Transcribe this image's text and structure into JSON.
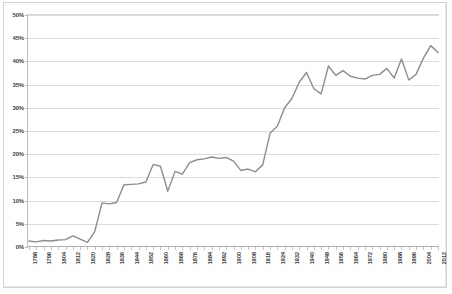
{
  "chart_data": {
    "type": "line",
    "title": "U.S. Popular Vote for President as Percentage of Total Population",
    "xlabel": "",
    "ylabel": "",
    "ylim": [
      0,
      50
    ],
    "ytick_labels": [
      "0%",
      "5%",
      "10%",
      "15%",
      "20%",
      "25%",
      "30%",
      "35%",
      "40%",
      "45%",
      "50%"
    ],
    "ytick_values": [
      0,
      5,
      10,
      15,
      20,
      25,
      30,
      35,
      40,
      45,
      50
    ],
    "grid": true,
    "legend": "none",
    "xtick_labels": [
      "1788",
      "1796",
      "1804",
      "1812",
      "1820",
      "1828",
      "1836",
      "1844",
      "1852",
      "1860",
      "1868",
      "1876",
      "1884",
      "1892",
      "1900",
      "1908",
      "1916",
      "1924",
      "1932",
      "1940",
      "1948",
      "1956",
      "1964",
      "1972",
      "1980",
      "1988",
      "1996",
      "2004",
      "2012"
    ],
    "x": [
      1788,
      1792,
      1796,
      1800,
      1804,
      1808,
      1812,
      1816,
      1820,
      1824,
      1828,
      1832,
      1836,
      1840,
      1844,
      1848,
      1852,
      1856,
      1860,
      1864,
      1868,
      1872,
      1876,
      1880,
      1884,
      1888,
      1892,
      1896,
      1900,
      1904,
      1908,
      1912,
      1916,
      1920,
      1924,
      1928,
      1932,
      1936,
      1940,
      1944,
      1948,
      1952,
      1956,
      1960,
      1964,
      1968,
      1972,
      1976,
      1980,
      1984,
      1988,
      1992,
      1996,
      2000,
      2004,
      2008,
      2012
    ],
    "values": [
      1.3,
      1.1,
      1.4,
      1.3,
      1.5,
      1.6,
      2.4,
      1.7,
      1.0,
      3.3,
      9.5,
      9.3,
      9.6,
      13.4,
      13.5,
      13.6,
      14.0,
      17.8,
      17.4,
      12.0,
      16.3,
      15.7,
      18.2,
      18.8,
      19.0,
      19.4,
      19.1,
      19.3,
      18.5,
      16.5,
      16.8,
      16.2,
      17.7,
      24.5,
      26.0,
      30.0,
      32.0,
      35.5,
      37.6,
      34.1,
      33.0,
      39.0,
      37.0,
      38.0,
      36.8,
      36.4,
      36.2,
      37.0,
      37.2,
      38.5,
      36.4,
      40.5,
      36.0,
      37.2,
      40.7,
      43.4,
      41.9
    ],
    "annotations": []
  },
  "chart_meta": {
    "line_color": "#8d8d8d",
    "grid_color": "#dcdcdc",
    "axis_color": "#b0b0b0",
    "plot_background": "#ffffff",
    "frame_color": "#d2d2d2",
    "text_color": "#3f3f3f"
  }
}
